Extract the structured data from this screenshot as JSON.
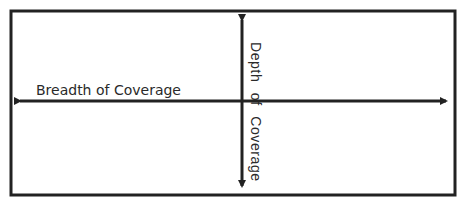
{
  "diagram": {
    "horizontal_label": "Breadth of Coverage",
    "vertical_label": "Depth of Coverage",
    "colors": {
      "stroke": "#222222",
      "background": "#ffffff",
      "text": "#2a2a2a"
    }
  }
}
